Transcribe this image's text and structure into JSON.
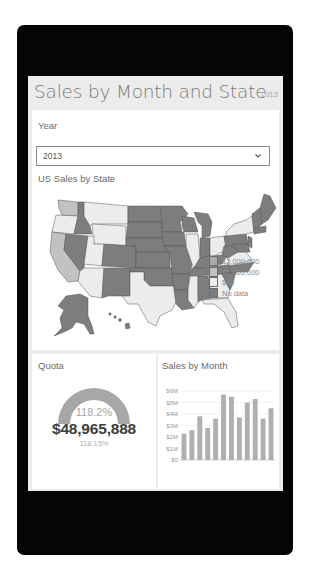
{
  "app": {
    "title": "Sales by Month and State",
    "title_year": "2013"
  },
  "year_filter": {
    "label": "Year",
    "selected": "2013",
    "icon": "chevron-down-icon"
  },
  "map": {
    "title": "US Sales by State",
    "legend": [
      {
        "label": "$2,000,000",
        "color": "#a9a9a9"
      },
      {
        "label": "$1,000,000",
        "color": "#c2c2c2"
      },
      {
        "label": "$40",
        "color": "#ececec"
      },
      {
        "label": "No data",
        "color": "#7d7d7d"
      }
    ]
  },
  "quota": {
    "title": "Quota",
    "gauge_percent_label": "118.2%",
    "value": "$48,965,888",
    "sub_label": "118.15%",
    "gauge_color": "#a7a7a7"
  },
  "sales_by_month": {
    "title": "Sales by Month",
    "bar_color": "#b0b0b0"
  },
  "chart_data": {
    "type": "bar",
    "title": "Sales by Month",
    "xlabel": "",
    "ylabel": "",
    "categories": [
      "1",
      "2",
      "3",
      "4",
      "5",
      "6",
      "7",
      "8",
      "9",
      "10",
      "11",
      "12"
    ],
    "values": [
      2.3,
      2.6,
      3.8,
      2.8,
      3.6,
      5.7,
      5.5,
      3.7,
      5.0,
      5.3,
      3.6,
      4.5
    ],
    "unit": "$M",
    "y_ticks": [
      "$0",
      "$1M",
      "$2M",
      "$3M",
      "$4M",
      "$5M",
      "$6M"
    ],
    "ylim": [
      0,
      6
    ],
    "grid": true,
    "legend": false
  }
}
